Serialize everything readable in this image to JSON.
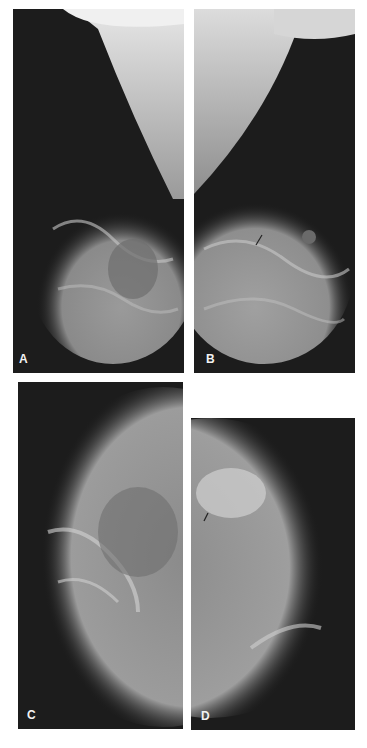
{
  "figure": {
    "panels": [
      {
        "id": "A",
        "label": "A",
        "view": "mediolateral oblique, right"
      },
      {
        "id": "B",
        "label": "B",
        "view": "mediolateral oblique, left",
        "annotation": "arrow"
      },
      {
        "id": "C",
        "label": "C",
        "view": "craniocaudal, right"
      },
      {
        "id": "D",
        "label": "D",
        "view": "craniocaudal, left",
        "annotation": "arrow"
      }
    ]
  }
}
